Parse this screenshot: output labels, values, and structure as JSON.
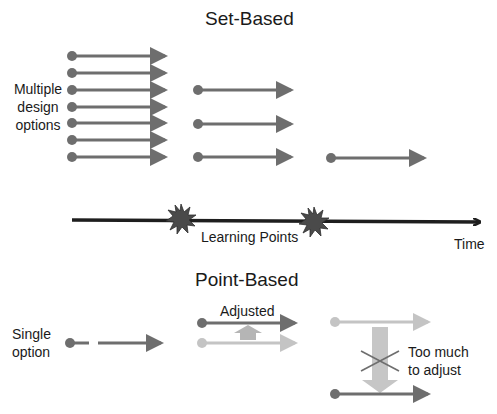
{
  "set_based": {
    "title": "Set-Based",
    "side_label_lines": [
      "Multiple",
      "design",
      "options"
    ],
    "stage1_arrow_count": 7,
    "stage2_arrow_count": 3,
    "stage3_arrow_count": 1
  },
  "timeline": {
    "learning_points_label": "Learning Points",
    "time_label": "Time",
    "learning_point_count": 2
  },
  "point_based": {
    "title": "Point-Based",
    "side_label_lines": [
      "Single",
      "option"
    ],
    "adjusted_label": "Adjusted",
    "too_much_label_lines": [
      "Too much",
      "to adjust"
    ]
  },
  "colors": {
    "arrow_dark": "#6e6e6e",
    "arrow_light": "#c4c4c4",
    "timeline": "#1e1e1e",
    "burst": "#4a4a4a",
    "text": "#1a1a1a"
  }
}
